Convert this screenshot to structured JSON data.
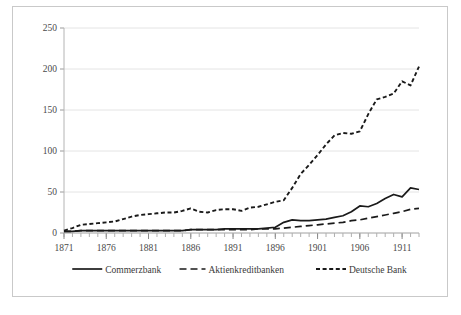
{
  "chart_data": {
    "type": "line",
    "title": "",
    "xlabel": "",
    "ylabel": "",
    "xlim": [
      1871,
      1913
    ],
    "ylim": [
      0,
      250
    ],
    "yticks": [
      0,
      50,
      100,
      150,
      200,
      250
    ],
    "ytick_labels": [
      "0",
      "50",
      "100",
      "150",
      "200",
      "250"
    ],
    "xticks": [
      1871,
      1876,
      1881,
      1886,
      1891,
      1896,
      1901,
      1906,
      1911
    ],
    "xtick_labels": [
      "1871",
      "1876",
      "1881",
      "1886",
      "1891",
      "1896",
      "1901",
      "1906",
      "1911"
    ],
    "minor_xticks_annual": true,
    "grid": "horizontal",
    "legend_position": "bottom",
    "x": [
      1871,
      1872,
      1873,
      1874,
      1875,
      1876,
      1877,
      1878,
      1879,
      1880,
      1881,
      1882,
      1883,
      1884,
      1885,
      1886,
      1887,
      1888,
      1889,
      1890,
      1891,
      1892,
      1893,
      1894,
      1895,
      1896,
      1897,
      1898,
      1899,
      1900,
      1901,
      1902,
      1903,
      1904,
      1905,
      1906,
      1907,
      1908,
      1909,
      1910,
      1911,
      1912,
      1913
    ],
    "series": [
      {
        "name": "Commerzbank",
        "style": "solid",
        "color": "#1a1a1a",
        "values": [
          2,
          2,
          3,
          3,
          3,
          3,
          3,
          3,
          3,
          3,
          3,
          3,
          3,
          3,
          3,
          4,
          4,
          4,
          4,
          5,
          5,
          5,
          5,
          5,
          6,
          7,
          13,
          16,
          15,
          15,
          16,
          17,
          19,
          21,
          26,
          33,
          32,
          36,
          42,
          47,
          44,
          55,
          53
        ]
      },
      {
        "name": "Aktienkreditbanken",
        "style": "dashed",
        "color": "#1a1a1a",
        "values": [
          2,
          2,
          3,
          3,
          3,
          3,
          3,
          3,
          3,
          3,
          3,
          3,
          3,
          3,
          3,
          4,
          4,
          4,
          4,
          4,
          4,
          4,
          4,
          5,
          5,
          5,
          6,
          7,
          8,
          9,
          10,
          11,
          12,
          13,
          15,
          16,
          18,
          20,
          22,
          24,
          26,
          29,
          30
        ]
      },
      {
        "name": "Deutsche Bank",
        "style": "dotted",
        "color": "#1a1a1a",
        "values": [
          3,
          6,
          10,
          11,
          12,
          13,
          14,
          17,
          20,
          22,
          23,
          24,
          25,
          25,
          27,
          30,
          26,
          25,
          28,
          29,
          29,
          27,
          31,
          32,
          35,
          38,
          40,
          55,
          72,
          83,
          95,
          108,
          119,
          122,
          121,
          124,
          145,
          163,
          166,
          170,
          185,
          180,
          203
        ]
      }
    ],
    "legend": [
      {
        "label": "Commerzbank",
        "style": "solid"
      },
      {
        "label": "Aktienkreditbanken",
        "style": "dashed"
      },
      {
        "label": "Deutsche Bank",
        "style": "dotted"
      }
    ]
  }
}
